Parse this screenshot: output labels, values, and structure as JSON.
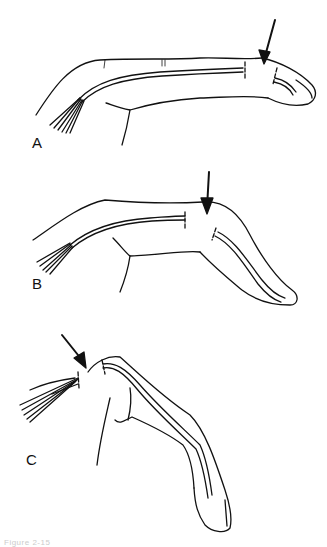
{
  "figure": {
    "panels": [
      {
        "label": "A",
        "description": "Finger extended; arrow at distal interphalangeal joint; extensor tendon divided"
      },
      {
        "label": "B",
        "description": "Finger with distal joint flexed; arrow at proximal region of middle phalanx"
      },
      {
        "label": "C",
        "description": "Finger fully flexed; arrow at metacarpophalangeal region"
      }
    ],
    "caption_fragment": "Figure 2-15"
  }
}
